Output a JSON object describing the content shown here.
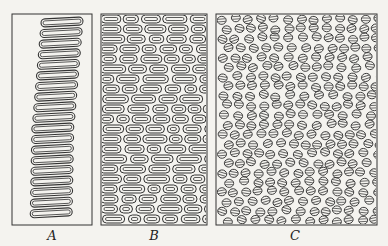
{
  "figure": {
    "background": "#f4f3ef",
    "ink": "#333333",
    "panels": [
      {
        "id": "A",
        "label": "A",
        "x": 12,
        "y": 14,
        "w": 80,
        "h": 211,
        "pattern": "long-loops",
        "rows": 19
      },
      {
        "id": "B",
        "label": "B",
        "x": 101,
        "y": 14,
        "w": 106,
        "h": 211,
        "pattern": "oval-cells",
        "rows": 21
      },
      {
        "id": "C",
        "label": "C",
        "x": 216,
        "y": 14,
        "w": 161,
        "h": 211,
        "pattern": "disc-stacks",
        "rows": 22
      }
    ],
    "labels": [
      {
        "text": "A",
        "x": 52
      },
      {
        "text": "B",
        "x": 154
      },
      {
        "text": "C",
        "x": 295
      }
    ]
  }
}
